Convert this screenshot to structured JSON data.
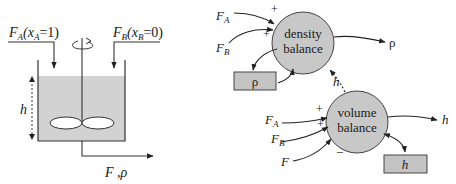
{
  "tank": {
    "inlet_a_label": "F",
    "inlet_a_sub": "A",
    "inlet_a_cond": "(x",
    "inlet_a_cond_sub": "A",
    "inlet_a_cond_val": "=1)",
    "inlet_b_label": "F",
    "inlet_b_sub": "B",
    "inlet_b_cond": "(x",
    "inlet_b_cond_sub": "B",
    "inlet_b_cond_val": "=0)",
    "level_label": "h",
    "outlet_label": "F ,ρ"
  },
  "density_balance": {
    "label_line1": "density",
    "label_line2": "balance",
    "input_a": "F",
    "input_a_sub": "A",
    "input_a_sign": "+",
    "input_b": "F",
    "input_b_sub": "B",
    "input_b_sign": "+",
    "output": "ρ",
    "state_box": "ρ",
    "feedback_h": "h"
  },
  "volume_balance": {
    "label_line1": "volume",
    "label_line2": "balance",
    "input_a": "F",
    "input_a_sub": "A",
    "input_a_sign": "+",
    "input_b": "F",
    "input_b_sub": "B",
    "input_b_sign": "+",
    "input_f": "F",
    "input_f_sign": "−",
    "output": "h",
    "state_box": "h"
  },
  "colors": {
    "liquid": "#d0d0d0",
    "node_fill": "#c8c8c8",
    "box_fill": "#c4c4c4",
    "stroke": "#333333"
  }
}
